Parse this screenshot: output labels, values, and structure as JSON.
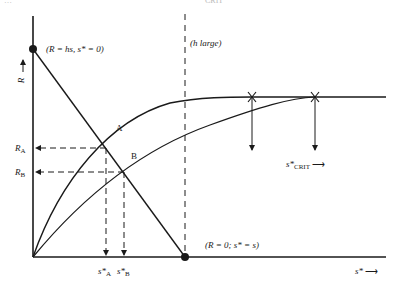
{
  "header_fragments": {
    "left": "…",
    "right": "CRIT"
  },
  "axes": {
    "y_label": "R",
    "y_arrow": "↑",
    "x_label": "s*",
    "x_arrow": "⟶"
  },
  "annotations": {
    "top_point": "(R = hs, s* = 0)",
    "bottom_point": "(R = 0; s* = s)",
    "h_large": "(h large)",
    "point_a": "A",
    "point_b": "B",
    "r_a": "R",
    "r_a_sub": "A",
    "r_b": "R",
    "r_b_sub": "B",
    "s_a": "s*",
    "s_a_sub": "A",
    "s_b": "s*",
    "s_b_sub": "B",
    "s_crit": "s*",
    "s_crit_sub": "CRIT",
    "s_crit_arrow": "⟶"
  },
  "colors": {
    "ink": "#1a1a1a",
    "background": "#ffffff"
  }
}
